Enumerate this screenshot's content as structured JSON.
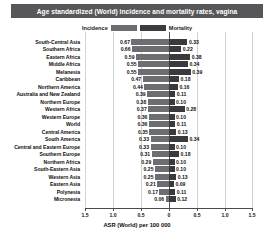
{
  "title": "Age standardized (World) incidence and mortality rates, vagina",
  "legend": {
    "incidence_label": "Incidence",
    "mortality_label": "Mortality",
    "incidence_color": "#6e6e72",
    "mortality_color": "#3a3a3e"
  },
  "axis": {
    "xlabel": "ASR (World) per 100 000",
    "ticks": [
      "1.5",
      "1.0",
      "0.5",
      "0",
      "0.5",
      "1.0",
      "1.5"
    ]
  },
  "chart_data": {
    "type": "bar",
    "orientation": "horizontal",
    "layout": "diverging-back-to-back",
    "title": "Age standardized (World) incidence and mortality rates, vagina",
    "xlabel": "ASR (World) per 100 000",
    "ylabel": "",
    "xlim": [
      -1.5,
      1.5
    ],
    "xticks": [
      -1.5,
      -1.0,
      -0.5,
      0,
      0.5,
      1.0,
      1.5
    ],
    "xticklabels": [
      "1.5",
      "1.0",
      "0.5",
      "0",
      "0.5",
      "1.0",
      "1.5"
    ],
    "grid": true,
    "legend_position": "top-center",
    "categories": [
      "South-Central Asia",
      "Southern Africa",
      "Eastern Africa",
      "Middle Africa",
      "Melanesia",
      "Caribbean",
      "Northern America",
      "Australia and New Zealand",
      "Northern Europe",
      "Western Africa",
      "Western Europe",
      "World",
      "Central America",
      "South America",
      "Central and Eastern Europe",
      "Southern Europe",
      "Northern Africa",
      "South-Eastern Asia",
      "Western Asia",
      "Eastern Asia",
      "Polynesia",
      "Micronesia"
    ],
    "series": [
      {
        "name": "Incidence",
        "direction": "left",
        "color": "#6e6e72",
        "values": [
          0.67,
          0.66,
          0.59,
          0.55,
          0.55,
          0.47,
          0.44,
          0.39,
          0.38,
          0.37,
          0.36,
          0.36,
          0.35,
          0.33,
          0.33,
          0.31,
          0.29,
          0.25,
          0.25,
          0.21,
          0.17,
          0.06
        ]
      },
      {
        "name": "Mortality",
        "direction": "right",
        "color": "#3a3a3e",
        "values": [
          0.33,
          0.22,
          0.38,
          0.34,
          0.39,
          0.18,
          0.16,
          0.11,
          0.1,
          0.28,
          0.1,
          0.11,
          0.13,
          0.34,
          0.1,
          0.18,
          0.1,
          0.1,
          0.13,
          0.09,
          0.11,
          0.12
        ]
      }
    ]
  }
}
